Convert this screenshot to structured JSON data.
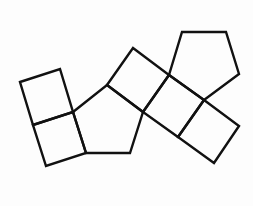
{
  "diagram": {
    "stroke_color": "#111111",
    "background_color": "#fdfdfd",
    "shapes": [
      {
        "name": "square-top-left",
        "type": "square",
        "points": "20,82 60,69 73,112 33,125"
      },
      {
        "name": "square-bottom-left",
        "type": "square",
        "points": "33,125 73,112 86,153 46,166"
      },
      {
        "name": "pentagon-left",
        "type": "pentagon",
        "points": "73,112 107,85 143,112 130,153 86,153"
      },
      {
        "name": "square-upper-middle",
        "type": "square",
        "points": "107,85 133,48 169,75 143,112"
      },
      {
        "name": "square-center",
        "type": "square",
        "points": "143,112 169,75 204,100 178,137"
      },
      {
        "name": "pentagon-right",
        "type": "pentagon",
        "points": "169,75 182,32 226,32 239,74 204,100"
      },
      {
        "name": "square-bottom-right",
        "type": "square",
        "points": "204,100 239,126 214,163 178,137"
      }
    ]
  }
}
